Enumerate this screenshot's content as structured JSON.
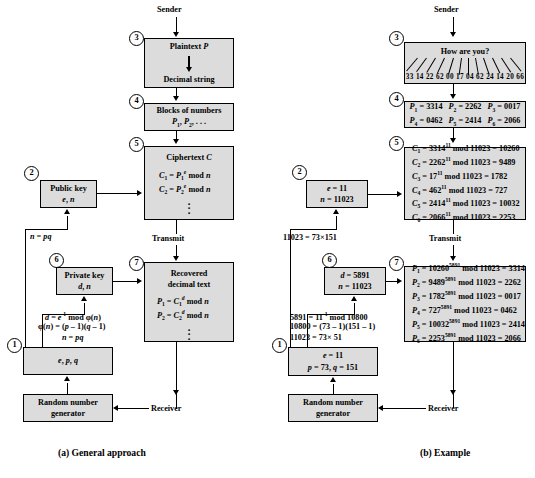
{
  "figure": {
    "caption_a": "(a) General approach",
    "caption_b": "(b) Example"
  },
  "panel_a": {
    "sender_label": "Sender",
    "transmit_label": "Transmit",
    "receiver_label": "Receiver",
    "steps": {
      "one": "1",
      "two": "2",
      "three": "3",
      "four": "4",
      "five": "5",
      "six": "6",
      "seven": "7"
    },
    "plaintext_box": {
      "line1": "Plaintext P",
      "line2": "Decimal string"
    },
    "blocks_box": {
      "line1": "Blocks of numbers",
      "line2": "P1, P2, . . ."
    },
    "ciphertext_box": {
      "title": "Ciphertext C",
      "eq1": "C1 = P1e mod n",
      "eq2": "C2 = P2e mod n"
    },
    "public_key_box": {
      "line1": "Public key",
      "line2": "e, n"
    },
    "private_key_box": {
      "line1": "Private key",
      "line2": "d, n"
    },
    "recovered_box": {
      "title1": "Recovered",
      "title2": "decimal text",
      "eq1": "P1 = C1d mod n",
      "eq2": "P2 = C2d mod n"
    },
    "keygen_box": {
      "line1": "e, p, q"
    },
    "rng_box": {
      "line1": "Random number",
      "line2": "generator"
    },
    "annotations": {
      "n_eq_pq": "n = pq",
      "d_formula": "d = e-1 mod ϕ(n)",
      "phi_formula": "ϕ(n) = (p - 1)(q - 1)",
      "n_formula": "n = pq"
    }
  },
  "panel_b": {
    "sender_label": "Sender",
    "transmit_label": "Transmit",
    "receiver_label": "Receiver",
    "steps": {
      "one": "1",
      "two": "2",
      "three": "3",
      "four": "4",
      "five": "5",
      "six": "6",
      "seven": "7"
    },
    "plaintext_box": {
      "message": "How are you?",
      "digits": "33 14 22 62 00 17 04 62 24 14 20 66",
      "digit_pairs": [
        "33",
        "14",
        "22",
        "62",
        "00",
        "17",
        "04",
        "62",
        "24",
        "14",
        "20",
        "66"
      ]
    },
    "blocks_box": {
      "row1": [
        "P1 = 3314",
        "P2 = 2262",
        "P3 = 0017"
      ],
      "row2": [
        "P4 = 0462",
        "P5 = 2414",
        "P6 = 2066"
      ]
    },
    "ciphertext_box": {
      "lines": [
        "C1 = 331411 mod 11023 = 10260",
        "C2 = 226211 mod 11023 = 9489",
        "C3 = 1711 mod 11023 = 1782",
        "C4 = 46211 mod 11023 = 727",
        "C5 = 241411 mod 11023 = 10032",
        "C6 = 206611 mod 11023 = 2253"
      ]
    },
    "public_key_box": {
      "line1": "e = 11",
      "line2": "n = 11023"
    },
    "private_key_box": {
      "line1": "d = 5891",
      "line2": "n = 11023"
    },
    "recovered_box": {
      "lines": [
        "P1 = 102605891 mod 11023 = 3314",
        "P2 = 94895891 mod 11023 = 2262",
        "P3 = 17825891 mod 11023 = 0017",
        "P4 = 7275891 mod 11023 = 0462",
        "P5 = 100325891 mod 11023 = 2414",
        "P6 = 22535891 mod 11023 = 2066"
      ]
    },
    "keygen_box": {
      "line1": "e = 11",
      "line2": "p = 73, q = 151"
    },
    "rng_box": {
      "line1": "Random number",
      "line2": "generator"
    },
    "annotations": {
      "n_factor": "11023 = 73×151",
      "d_formula": "5891 = 11-1 mod 10800",
      "phi_formula": "10800 = (73 - 1)(151 - 1)",
      "n_formula": "11023 = 73× 51"
    }
  }
}
